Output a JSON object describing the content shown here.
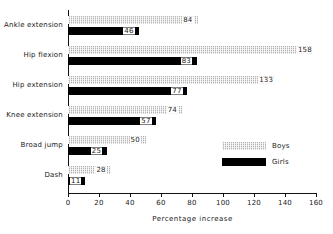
{
  "chart_data": {
    "type": "bar",
    "orientation": "horizontal",
    "title": "",
    "xlabel": "Percentage increase",
    "ylabel": "",
    "xlim": [
      0,
      160
    ],
    "xticks": [
      0,
      20,
      40,
      60,
      80,
      100,
      120,
      140,
      160
    ],
    "grid": false,
    "legend_position": "inside-right",
    "categories": [
      "Ankle extension",
      "Hip flexion",
      "Hip extension",
      "Knee extension",
      "Broad jump",
      "Dash"
    ],
    "series": [
      {
        "name": "Boys",
        "color": "#b5b5b5",
        "pattern": "hatched",
        "values": [
          84,
          158,
          133,
          74,
          50,
          28
        ]
      },
      {
        "name": "Girls",
        "color": "#000000",
        "pattern": "solid",
        "values": [
          46,
          83,
          77,
          57,
          25,
          11
        ]
      }
    ]
  },
  "legend": {
    "items": [
      {
        "label": "Boys"
      },
      {
        "label": "Girls"
      }
    ]
  }
}
